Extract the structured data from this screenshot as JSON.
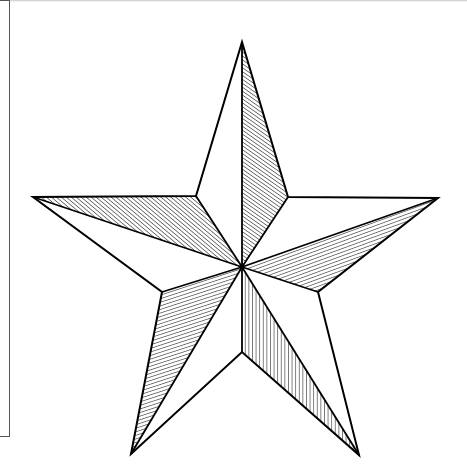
{
  "image": {
    "subject": "nautical-star line drawing",
    "colors": {
      "line": "#000000",
      "background": "#ffffff"
    },
    "star": {
      "center": [
        242,
        267
      ],
      "outer_points": {
        "top": [
          242,
          42
        ],
        "right": [
          438,
          198
        ],
        "bottom_right": [
          359,
          455
        ],
        "bottom_left": [
          131,
          454
        ],
        "left": [
          33,
          197
        ]
      },
      "inner_points": {
        "top_right": [
          288,
          197
        ],
        "right": [
          318,
          292
        ],
        "bottom": [
          242,
          352
        ],
        "left": [
          162,
          292
        ],
        "top_left": [
          196,
          196
        ]
      }
    }
  }
}
